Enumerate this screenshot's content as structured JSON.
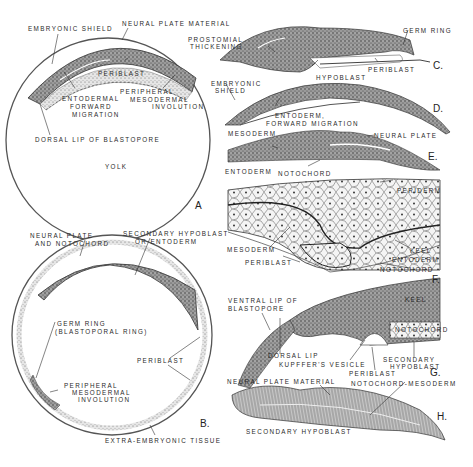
{
  "figure": {
    "panels": [
      {
        "id": "A",
        "letter": "A",
        "labels": [
          "EMBRYONIC SHIELD",
          "NEURAL PLATE MATERIAL",
          "PERIBLAST",
          "ENTODERMAL",
          "FORWARD",
          "MIGRATION",
          "PERIPHERAL",
          "MESODERMAL",
          "INVOLUTION",
          "DORSAL LIP OF BLASTOPORE",
          "YOLK"
        ]
      },
      {
        "id": "B",
        "letter": "B.",
        "labels": [
          "NEURAL PLATE",
          "AND NOTOCHORD",
          "SECONDARY HYPOBLAST",
          "OR ENTODERM",
          "GERM RING",
          "(BLASTOPORAL RING)",
          "PERIBLAST",
          "PERIPHERAL",
          "MESODERMAL",
          "INVOLUTION",
          "EXTRA-EMBRYONIC TISSUE"
        ]
      },
      {
        "id": "C",
        "letter": "C.",
        "labels": [
          "PROSTOMIAL",
          "THICKENING",
          "GERM RING",
          "HYPOBLAST",
          "PERIBLAST"
        ]
      },
      {
        "id": "D",
        "letter": "D.",
        "labels": [
          "EMBRYONIC",
          "SHIELD",
          "ENTODERM,",
          "FORWARD MIGRATION"
        ]
      },
      {
        "id": "E",
        "letter": "E.",
        "labels": [
          "MESODERM",
          "NEURAL PLATE",
          "ENTODERM",
          "NOTOCHORD"
        ]
      },
      {
        "id": "F",
        "letter": "F.",
        "labels": [
          "PERIDERM",
          "MESODERM",
          "KEEL",
          "ENTODERM",
          "PERIBLAST",
          "NOTOCHORD"
        ]
      },
      {
        "id": "G",
        "letter": "G.",
        "labels": [
          "VENTRAL LIP OF",
          "BLASTOPORE",
          "KEEL",
          "NOTOCHORD",
          "DORSAL LIP",
          "KUPFFER'S VESICLE",
          "SECONDARY",
          "HYPOBLAST",
          "PERIBLAST"
        ]
      },
      {
        "id": "H",
        "letter": "H.",
        "labels": [
          "NEURAL PLATE MATERIAL",
          "NOTOCHORD-MESODERM",
          "SECONDARY HYPOBLAST"
        ]
      }
    ]
  },
  "colors": {
    "ink": "#2a2a2a",
    "stipple": "#6a6a6a",
    "paper": "#ffffff",
    "cell": "#f3f3f3"
  }
}
